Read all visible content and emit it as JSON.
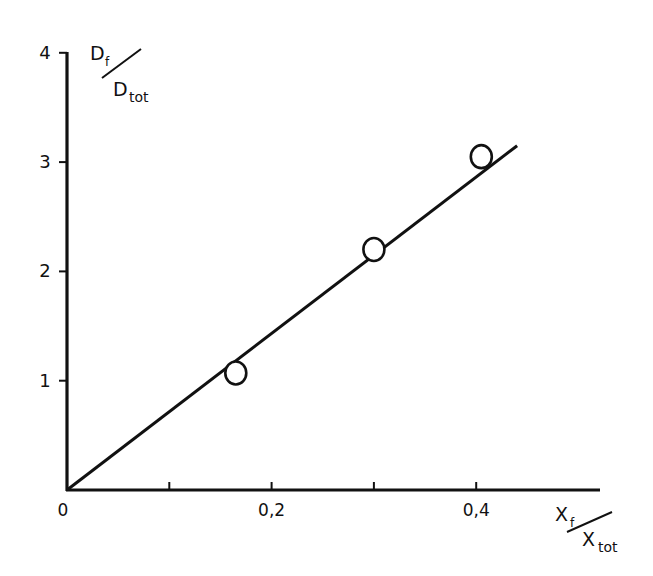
{
  "chart_data": {
    "type": "scatter",
    "title": "",
    "xlabel": "X_f / X_tot",
    "ylabel": "D_f / D_tot",
    "x_label_parts": {
      "num": "X",
      "num_sub": "f",
      "den": "X",
      "den_sub": "tot"
    },
    "y_label_parts": {
      "num": "D",
      "num_sub": "f",
      "den": "D",
      "den_sub": "tot"
    },
    "xlim": [
      0,
      0.52
    ],
    "ylim": [
      0,
      4
    ],
    "x_ticks": [
      0.1,
      0.2,
      0.3,
      0.4
    ],
    "x_tick_labels": [
      {
        "value": 0,
        "label": "0"
      },
      {
        "value": 0.2,
        "label": "0,2"
      },
      {
        "value": 0.4,
        "label": "0,4"
      }
    ],
    "y_ticks": [
      1,
      2,
      3,
      4
    ],
    "y_tick_labels": [
      {
        "value": 1,
        "label": "1"
      },
      {
        "value": 2,
        "label": "2"
      },
      {
        "value": 3,
        "label": "3"
      },
      {
        "value": 4,
        "label": "4"
      }
    ],
    "grid": false,
    "legend": null,
    "series": [
      {
        "name": "measured",
        "marker": "open-circle",
        "x": [
          0.165,
          0.3,
          0.405
        ],
        "y": [
          1.07,
          2.2,
          3.05
        ]
      },
      {
        "name": "fit line",
        "style": "line",
        "x": [
          0,
          0.44
        ],
        "y": [
          0,
          3.15
        ]
      }
    ]
  }
}
